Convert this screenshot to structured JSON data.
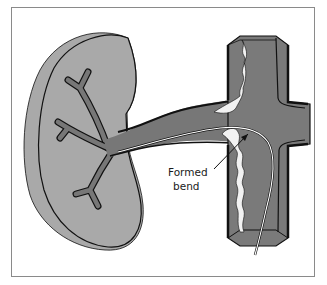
{
  "diagram": {
    "colors": {
      "kidney_fill": "#a9a9a9",
      "vessel_fill": "#7a7a7a",
      "vessel_dark": "#6f6f6f",
      "outline": "#111111",
      "plaque": "#f2f2f2",
      "catheter": "#ffffff",
      "frame": "#8a8a8a"
    },
    "labels": {
      "annotation_line1": "Formed",
      "annotation_line2": "bend"
    }
  }
}
